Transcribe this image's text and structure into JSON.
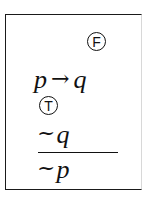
{
  "argument": {
    "premise_1": {
      "antecedent": "p",
      "connective": "→",
      "consequent": "q",
      "truth_mark": "F",
      "truth_mark_label": "false"
    },
    "premise_2": {
      "negation": "~",
      "variable": "q",
      "truth_mark": "T",
      "truth_mark_label": "true"
    },
    "conclusion": {
      "negation": "~",
      "variable": "p"
    }
  },
  "colors": {
    "ink": "#111111",
    "background": "#ffffff"
  }
}
